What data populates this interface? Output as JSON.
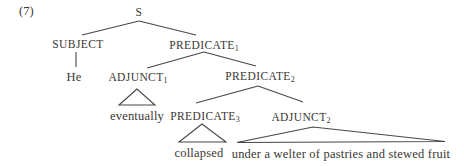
{
  "figure": {
    "number_label": "(7)",
    "background_color": "#ffffff",
    "text_color": "#3b3733",
    "line_color": "#4a4642"
  },
  "tree": {
    "root": "S",
    "nodes": {
      "s": {
        "label": "S",
        "sub": ""
      },
      "subject": {
        "label": "SUBJECT",
        "sub": ""
      },
      "predicate1": {
        "label": "PREDICATE",
        "sub": "1"
      },
      "he": {
        "label": "He",
        "sub": ""
      },
      "adjunct1": {
        "label": "ADJUNCT",
        "sub": "1"
      },
      "predicate2": {
        "label": "PREDICATE",
        "sub": "2"
      },
      "eventually": {
        "label": "eventually",
        "sub": ""
      },
      "predicate3": {
        "label": "PREDICATE",
        "sub": "3"
      },
      "adjunct2": {
        "label": "ADJUNCT",
        "sub": "2"
      },
      "collapsed": {
        "label": "collapsed",
        "sub": ""
      },
      "phrase": {
        "label": "under a welter of pastries and stewed fruit",
        "sub": ""
      }
    },
    "edges": [
      {
        "from": "S",
        "to": "SUBJECT"
      },
      {
        "from": "S",
        "to": "PREDICATE1"
      },
      {
        "from": "SUBJECT",
        "to": "He"
      },
      {
        "from": "PREDICATE1",
        "to": "ADJUNCT1"
      },
      {
        "from": "PREDICATE1",
        "to": "PREDICATE2"
      },
      {
        "from": "PREDICATE2",
        "to": "PREDICATE3"
      },
      {
        "from": "PREDICATE2",
        "to": "ADJUNCT2"
      },
      {
        "from": "ADJUNCT1",
        "to": "eventually",
        "triangle": true
      },
      {
        "from": "PREDICATE3",
        "to": "collapsed",
        "triangle": true
      },
      {
        "from": "ADJUNCT2",
        "to": "under a welter of pastries and stewed fruit",
        "triangle": true
      }
    ]
  }
}
